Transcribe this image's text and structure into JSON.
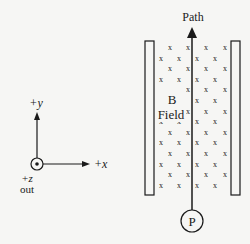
{
  "diagram": {
    "type": "physics-magnetic-field-setup",
    "axes": {
      "y_label": "+y",
      "x_label": "+x",
      "z_label": "+z",
      "z_direction": "out",
      "origin_symbol": "dot-in-circle (out of page)"
    },
    "field": {
      "label_line1": "B",
      "label_line2": "Field",
      "symbol": "x",
      "direction": "into page",
      "rows": 14
    },
    "plates": {
      "count": 2,
      "orientation": "vertical"
    },
    "path": {
      "label": "Path",
      "direction": "+y"
    },
    "particle": {
      "label": "P"
    },
    "colors": {
      "ink": "#1a1a1a",
      "background": "#f6f6f4"
    }
  }
}
